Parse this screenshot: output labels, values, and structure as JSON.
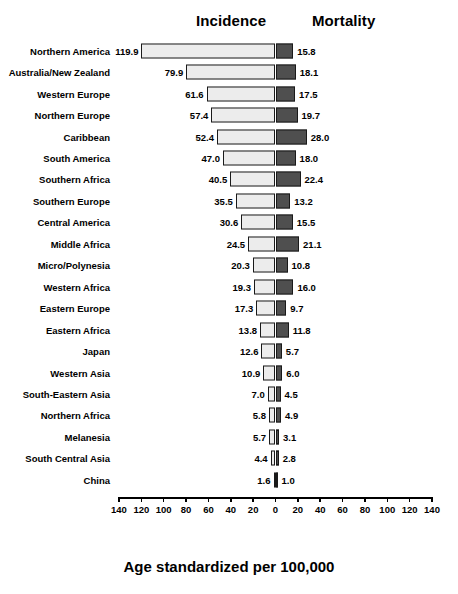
{
  "header": {
    "incidence_label": "Incidence",
    "mortality_label": "Mortality"
  },
  "axis_title": "Age standardized per 100,000",
  "chart_data": {
    "type": "bar",
    "orientation": "horizontal",
    "subtype": "diverging-bidirectional",
    "title": "",
    "subtitle": "",
    "xlabel": "Age standardized per 100,000",
    "ylabel": "",
    "xlim": [
      -140,
      140
    ],
    "xticks": [
      -140,
      -120,
      -100,
      -80,
      -60,
      -40,
      -20,
      0,
      20,
      40,
      60,
      80,
      100,
      120,
      140
    ],
    "xticklabels": [
      "140",
      "120",
      "100",
      "80",
      "60",
      "40",
      "20",
      "0",
      "20",
      "40",
      "60",
      "80",
      "100",
      "120",
      "140"
    ],
    "grid": false,
    "legend_position": "top",
    "categories": [
      "Northern America",
      "Australia/New Zealand",
      "Western Europe",
      "Northern Europe",
      "Caribbean",
      "South America",
      "Southern Africa",
      "Southern Europe",
      "Central America",
      "Middle Africa",
      "Micro/Polynesia",
      "Western Africa",
      "Eastern Europe",
      "Eastern Africa",
      "Japan",
      "Western Asia",
      "South-Eastern Asia",
      "Northern Africa",
      "Melanesia",
      "South Central Asia",
      "China"
    ],
    "series": [
      {
        "name": "Incidence",
        "direction": "left",
        "color": "#ececec",
        "values": [
          119.9,
          79.9,
          61.6,
          57.4,
          52.4,
          47.0,
          40.5,
          35.5,
          30.6,
          24.5,
          20.3,
          19.3,
          17.3,
          13.8,
          12.6,
          10.9,
          7.0,
          5.8,
          5.7,
          4.4,
          1.6
        ],
        "labels": [
          "119.9",
          "79.9",
          "61.6",
          "57.4",
          "52.4",
          "47.0",
          "40.5",
          "35.5",
          "30.6",
          "24.5",
          "20.3",
          "19.3",
          "17.3",
          "13.8",
          "12.6",
          "10.9",
          "7.0",
          "5.8",
          "5.7",
          "4.4",
          "1.6"
        ]
      },
      {
        "name": "Mortality",
        "direction": "right",
        "color": "#4f4f4f",
        "values": [
          15.8,
          18.1,
          17.5,
          19.7,
          28.0,
          18.0,
          22.4,
          13.2,
          15.5,
          21.1,
          10.8,
          16.0,
          9.7,
          11.8,
          5.7,
          6.0,
          4.5,
          4.9,
          3.1,
          2.8,
          1.0
        ],
        "labels": [
          "15.8",
          "18.1",
          "17.5",
          "19.7",
          "28.0",
          "18.0",
          "22.4",
          "13.2",
          "15.5",
          "21.1",
          "10.8",
          "16.0",
          "9.7",
          "11.8",
          "5.7",
          "6.0",
          "4.5",
          "4.9",
          "3.1",
          "2.8",
          "1.0"
        ]
      }
    ]
  }
}
